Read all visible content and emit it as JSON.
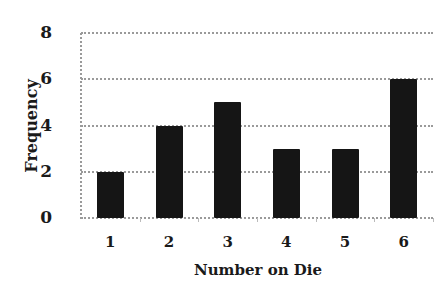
{
  "chart_data": {
    "type": "bar",
    "title": "",
    "xlabel": "Number on Die",
    "ylabel": "Frequency",
    "categories": [
      "1",
      "2",
      "3",
      "4",
      "5",
      "6"
    ],
    "values": [
      2,
      4,
      5,
      3,
      3,
      6
    ],
    "ylim": [
      0,
      8
    ],
    "yticks": [
      "0",
      "2",
      "4",
      "6",
      "8"
    ],
    "grid": true,
    "legend": null,
    "bar_color": "#151515",
    "grid_color": "#9a9a9a"
  }
}
